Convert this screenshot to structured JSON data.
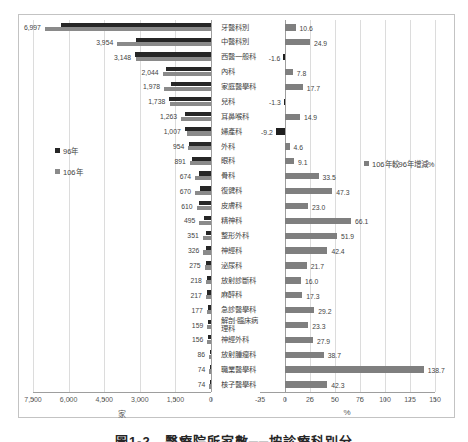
{
  "caption": "圖1-2　醫療院所家數──按診療科別分",
  "legend_left": {
    "items": [
      {
        "label": "96年",
        "color": "#262626"
      },
      {
        "label": "106年",
        "color": "#8a8a8a"
      }
    ]
  },
  "legend_right": {
    "label": "106年較96年增減%",
    "color": "#7f7f7f"
  },
  "left_axis": {
    "title": "家",
    "ticks": [
      "7,500",
      "6,000",
      "4,500",
      "3,000",
      "1,500",
      "0"
    ]
  },
  "right_axis": {
    "title": "%",
    "ticks": [
      "-25",
      "0",
      "25",
      "50",
      "75",
      "100",
      "125",
      "150"
    ]
  },
  "colors": {
    "bar_96": "#262626",
    "bar_106": "#8a8a8a",
    "bar_growth": "#7f7f7f",
    "bar_growth_negative": "#1f1f1f",
    "gridline": "#dcdcdc",
    "axis_line": "#9e9e9e"
  },
  "chart_data": {
    "type": "bar",
    "orientation": "horizontal",
    "categories": [
      "牙醫科別",
      "中醫科別",
      "西醫一般科",
      "內科",
      "家庭醫學科",
      "兒科",
      "耳鼻喉科",
      "婦產科",
      "外科",
      "眼科",
      "骨科",
      "復健科",
      "皮膚科",
      "精神科",
      "整形外科",
      "神經科",
      "泌尿科",
      "放射診斷科",
      "麻醉科",
      "急診醫學科",
      "解剖‧臨床病理科",
      "神經外科",
      "放射腫瘤科",
      "職業醫學科",
      "核子醫學科"
    ],
    "left_chart": {
      "xlabel": "家",
      "xlim": [
        7500,
        0
      ],
      "tick_values": [
        7500,
        6000,
        4500,
        3000,
        1500,
        0
      ],
      "series": [
        {
          "name": "96年",
          "estimated_from_growth": true,
          "values": [
            6326,
            3166,
            3199,
            1896,
            1681,
            1761,
            1099,
            1109,
            912,
            817,
            505,
            455,
            496,
            298,
            231,
            229,
            226,
            188,
            185,
            137,
            129,
            122,
            62,
            31,
            52
          ]
        },
        {
          "name": "106年",
          "values": [
            6997,
            3954,
            3148,
            2044,
            1978,
            1738,
            1263,
            1007,
            954,
            891,
            674,
            670,
            610,
            495,
            351,
            326,
            275,
            218,
            217,
            177,
            159,
            156,
            86,
            74,
            74
          ],
          "labels": [
            "6,997",
            "3,954",
            "3,148",
            "2,044",
            "1,978",
            "1,738",
            "1,263",
            "1,007",
            "954",
            "891",
            "674",
            "670",
            "610",
            "495",
            "351",
            "326",
            "275",
            "218",
            "217",
            "177",
            "159",
            "156",
            "86",
            "74",
            "74"
          ]
        }
      ]
    },
    "right_chart": {
      "xlabel": "%",
      "xlim": [
        -25,
        150
      ],
      "tick_values": [
        -25,
        0,
        25,
        50,
        75,
        100,
        125,
        150
      ],
      "series": [
        {
          "name": "106年較96年增減%",
          "values": [
            10.6,
            24.9,
            -1.6,
            7.8,
            17.7,
            -1.3,
            14.9,
            -9.2,
            4.6,
            9.1,
            33.5,
            47.3,
            23.0,
            66.1,
            51.9,
            42.4,
            21.7,
            16.0,
            17.3,
            29.2,
            23.3,
            27.9,
            38.7,
            138.7,
            42.3
          ],
          "labels": [
            "10.6",
            "24.9",
            "-1.6",
            "7.8",
            "17.7",
            "-1.3",
            "14.9",
            "-9.2",
            "4.6",
            "9.1",
            "33.5",
            "47.3",
            "23.0",
            "66.1",
            "51.9",
            "42.4",
            "21.7",
            "16.0",
            "17.3",
            "29.2",
            "23.3",
            "27.9",
            "38.7",
            "138.7",
            "42.3"
          ]
        }
      ]
    }
  }
}
